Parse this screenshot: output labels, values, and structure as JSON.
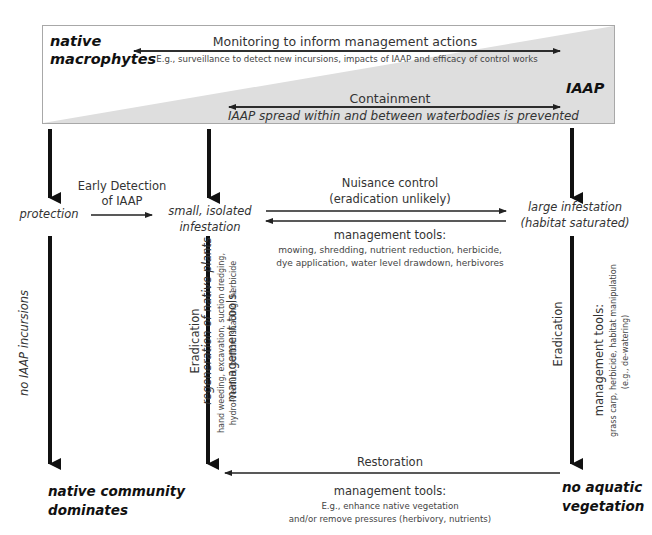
{
  "diagram": {
    "title_box": {
      "left_label": [
        "native",
        "macrophytes"
      ],
      "right_label": "IAAP",
      "monitoring": {
        "title": "Monitoring to inform management actions",
        "detail": "E.g., surveillance to detect new incursions, impacts of IAAP and efficacy of control works"
      },
      "containment": {
        "title": "Containment",
        "detail": "IAAP spread within and between waterbodies is prevented"
      },
      "colors": {
        "border": "#a0a0a0",
        "gradient_fill": "#dcdcdc",
        "background": "#ffffff"
      }
    },
    "nodes": {
      "protection": "protection",
      "small_infestation": [
        "small, isolated",
        "infestation"
      ],
      "large_infestation": [
        "large infestation",
        "(habitat saturated)"
      ],
      "native_community": [
        "native community",
        "dominates"
      ],
      "no_aquatic": [
        "no aquatic",
        "vegetation"
      ]
    },
    "edges": {
      "early_detection": [
        "Early Detection",
        "of IAAP"
      ],
      "nuisance_control": {
        "title": [
          "Nuisance control",
          "(eradication unlikely)"
        ],
        "tools_label": "management tools:",
        "tools": [
          "mowing, shredding, nutrient reduction, herbicide,",
          "dye application, water level drawdown, herbivores"
        ]
      },
      "no_incursions": "no IAAP incursions",
      "eradication_left": {
        "title": "Eradication",
        "subtitle": "regeneration of native plants",
        "tools_label": "management tools:",
        "tools": [
          "hand weeding, excavation, suction dredging,",
          "hydro-venturi, bottom shading, herbicide"
        ]
      },
      "eradication_right": {
        "title": "Eradication",
        "tools_label": "management tools:",
        "tools": [
          "grass carp, herbicide, habitat manipulation",
          "(e.g., de-watering)"
        ]
      },
      "restoration": {
        "title": "Restoration",
        "tools_label": "management tools:",
        "tools": [
          "E.g., enhance native vegetation",
          "and/or remove pressures (herbivory, nutrients)"
        ]
      }
    }
  }
}
